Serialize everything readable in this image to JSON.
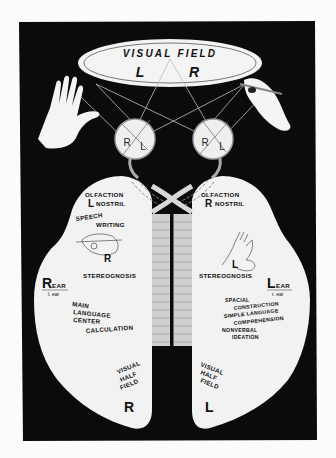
{
  "diagram": {
    "colors": {
      "background": "#fbfbfb",
      "panel": "#0b0b0b",
      "brain": "#f2f2f2",
      "callosum": "#d8d8d8",
      "text": "#111111"
    },
    "visual_field": {
      "title": "VISUAL FIELD",
      "left": "L",
      "right": "R"
    },
    "eyes": {
      "left_eye": {
        "r": "R",
        "l": "L"
      },
      "right_eye": {
        "r": "R",
        "l": "L"
      }
    },
    "hands": {
      "left": "open-hand-icon",
      "right": "writing-hand-icon"
    },
    "left_hemisphere": {
      "olfaction": "OLFACTION",
      "olfaction_side": "L",
      "nostril": "NOSTRIL",
      "speech": "SPEECH",
      "writing": "WRITING",
      "hand_side": "R",
      "stereognosis": "STEREOGNOSIS",
      "ear_side": "R",
      "ear": "EAR",
      "ear_sub": "l. ear",
      "functions": [
        "MAIN",
        "LANGUAGE",
        "CENTER"
      ],
      "calculation": "CALCULATION",
      "visual_half_field": [
        "VISUAL",
        "HALF",
        "FIELD"
      ],
      "field_side": "R"
    },
    "right_hemisphere": {
      "olfaction": "OLFACTION",
      "olfaction_side": "R",
      "nostril": "NOSTRIL",
      "hand_side": "L",
      "stereognosis": "STEREOGNOSIS",
      "ear_side": "L",
      "ear": "EAR",
      "ear_sub": "r. ear",
      "functions": [
        "SPACIAL",
        "CONSTRUCTION",
        "SIMPLE LANGUAGE",
        "COMPREHENSION",
        "NONVERBAL",
        "IDEATION"
      ],
      "visual_half_field": [
        "VISUAL",
        "HALF",
        "FIELD"
      ],
      "field_side": "L"
    }
  }
}
